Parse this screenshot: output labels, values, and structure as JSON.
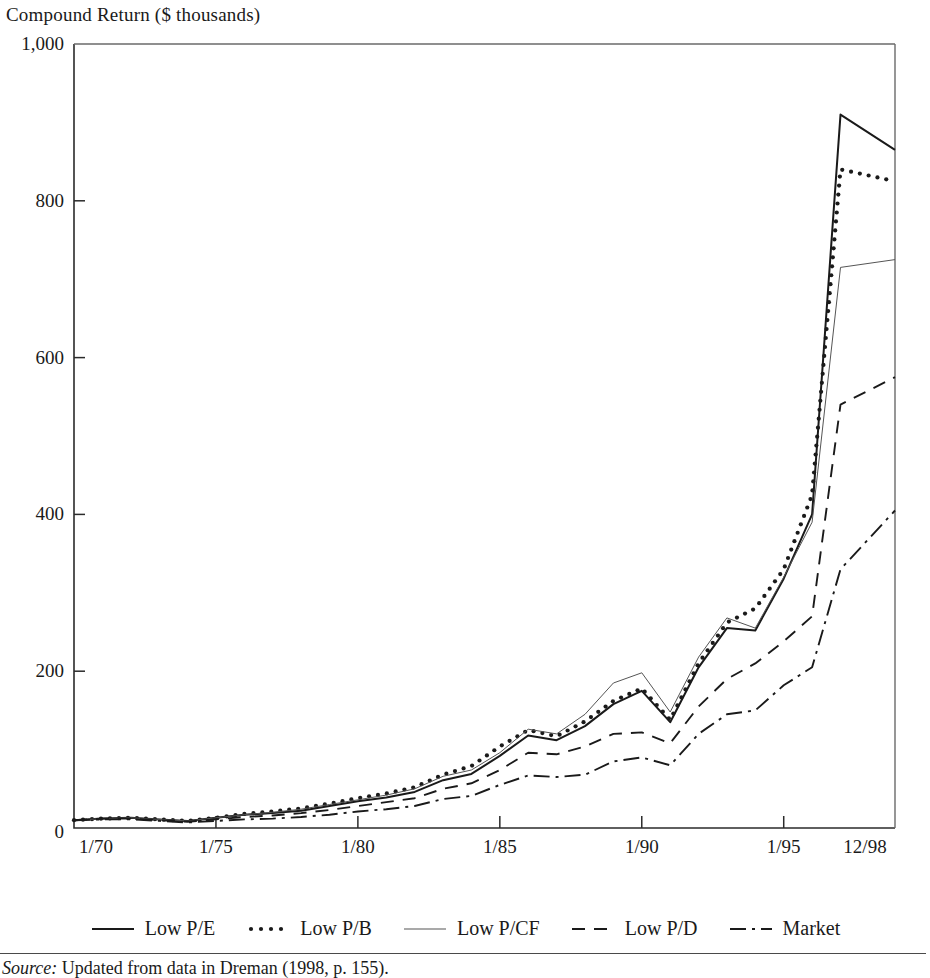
{
  "figure": {
    "axis_title": "Compound Return ($ thousands)",
    "source_prefix": "Source:",
    "source_text": " Updated from data in Dreman (1998, p. 155)."
  },
  "legend": {
    "items": [
      {
        "label": "Low P/E",
        "key": "solid-thick-line-icon"
      },
      {
        "label": "Low P/B",
        "key": "dotted-line-icon"
      },
      {
        "label": "Low P/CF",
        "key": "thin-solid-line-icon"
      },
      {
        "label": "Low P/D",
        "key": "dashed-line-icon"
      },
      {
        "label": "Market",
        "key": "dash-dot-line-icon"
      }
    ]
  },
  "chart_data": {
    "type": "line",
    "title": "",
    "subtitle": "",
    "xlabel": "",
    "ylabel": "Compound Return ($ thousands)",
    "ylim": [
      0,
      1000
    ],
    "yticks": [
      0,
      200,
      400,
      600,
      800,
      1000
    ],
    "ytick_labels": [
      "0",
      "200",
      "400",
      "600",
      "800",
      "1,000"
    ],
    "xticks": [
      1970,
      1975,
      1980,
      1985,
      1990,
      1995,
      1998.92
    ],
    "xtick_labels": [
      "1/70",
      "1/75",
      "1/80",
      "1/85",
      "1/90",
      "1/95",
      "12/98"
    ],
    "xlim": [
      1970,
      1998.92
    ],
    "grid": false,
    "legend_position": "bottom",
    "x": [
      1970,
      1971,
      1972,
      1973,
      1974,
      1975,
      1976,
      1977,
      1978,
      1979,
      1980,
      1981,
      1982,
      1983,
      1984,
      1985,
      1986,
      1987,
      1988,
      1989,
      1990,
      1991,
      1992,
      1993,
      1994,
      1995,
      1996,
      1997,
      1998.92
    ],
    "series": [
      {
        "name": "Low P/E",
        "style": "solid",
        "color": "#1a1a1a",
        "values": [
          10,
          12,
          13,
          11,
          9,
          13,
          17,
          19,
          22,
          28,
          34,
          39,
          46,
          61,
          69,
          92,
          118,
          112,
          130,
          158,
          175,
          135,
          205,
          255,
          252,
          318,
          400,
          910,
          865
        ]
      },
      {
        "name": "Low P/B",
        "style": "dotted",
        "color": "#1a1a1a",
        "values": [
          10,
          12,
          13,
          11,
          9,
          13,
          18,
          21,
          25,
          31,
          38,
          44,
          52,
          68,
          79,
          104,
          125,
          117,
          136,
          162,
          178,
          138,
          210,
          262,
          280,
          330,
          425,
          840,
          825
        ]
      },
      {
        "name": "Low P/CF",
        "style": "thin-solid",
        "color": "#555555",
        "values": [
          10,
          12,
          13,
          11,
          9,
          13,
          17,
          20,
          24,
          30,
          36,
          42,
          50,
          66,
          74,
          96,
          126,
          120,
          145,
          185,
          198,
          148,
          218,
          268,
          255,
          320,
          390,
          715,
          725
        ]
      },
      {
        "name": "Low P/D",
        "style": "dashed",
        "color": "#1a1a1a",
        "values": [
          10,
          12,
          12,
          10,
          8,
          11,
          14,
          16,
          19,
          23,
          28,
          33,
          38,
          50,
          57,
          74,
          96,
          94,
          104,
          120,
          122,
          108,
          155,
          190,
          210,
          238,
          270,
          540,
          575
        ]
      },
      {
        "name": "Market",
        "style": "dash-dot",
        "color": "#1a1a1a",
        "values": [
          10,
          11,
          11,
          9,
          7,
          9,
          11,
          12,
          14,
          17,
          21,
          24,
          28,
          37,
          41,
          55,
          67,
          65,
          68,
          85,
          90,
          80,
          120,
          145,
          150,
          182,
          205,
          330,
          405
        ]
      }
    ]
  }
}
